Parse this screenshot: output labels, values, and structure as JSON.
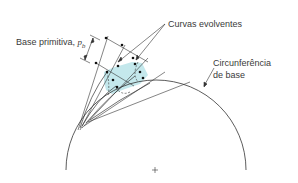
{
  "labels": {
    "curvas": "Curvas evolventes",
    "base_primitiva": "Base primitiva, ",
    "base_primitiva_symbol": "p",
    "base_primitiva_sub": "b",
    "circ_line1": "Circunferência",
    "circ_line2": "de base",
    "center_mark": "+"
  },
  "colors": {
    "line": "#333333",
    "tooth_fill": "#bfe6ea",
    "text": "#3a3a3a"
  }
}
